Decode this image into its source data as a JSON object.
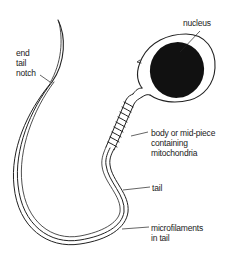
{
  "diagram": {
    "labels": {
      "nucleus": "nucleus",
      "end_tail_notch": "end\ntail\nnotch",
      "body": "body or mid-piece\ncontaining\nmitochondria",
      "tail": "tail",
      "microfilaments": "microfilaments\nin tail"
    },
    "colors": {
      "line": "#222222",
      "nucleus_fill": "#111111",
      "background": "#ffffff"
    }
  }
}
